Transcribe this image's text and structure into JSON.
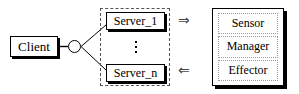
{
  "diagram": {
    "client": {
      "label": "Client"
    },
    "junction": {
      "name": "connector-junction"
    },
    "server_group": {
      "servers": [
        {
          "label": "Server_1"
        },
        {
          "label": "Server_n"
        }
      ],
      "ellipsis": "vertical-dots"
    },
    "arrows": [
      {
        "glyph": "⇒",
        "direction": "right",
        "name": "arrow-to-manager"
      },
      {
        "glyph": "⇐",
        "direction": "left",
        "name": "arrow-from-manager"
      }
    ],
    "manager_panel": {
      "cells": [
        {
          "label": "Sensor"
        },
        {
          "label": "Manager"
        },
        {
          "label": "Effector"
        }
      ]
    },
    "colors": {
      "stroke": "#000000",
      "dashed_group": "#555555",
      "dotted_cell": "#999999",
      "arrow": "#444444",
      "background": "#ffffff"
    }
  }
}
